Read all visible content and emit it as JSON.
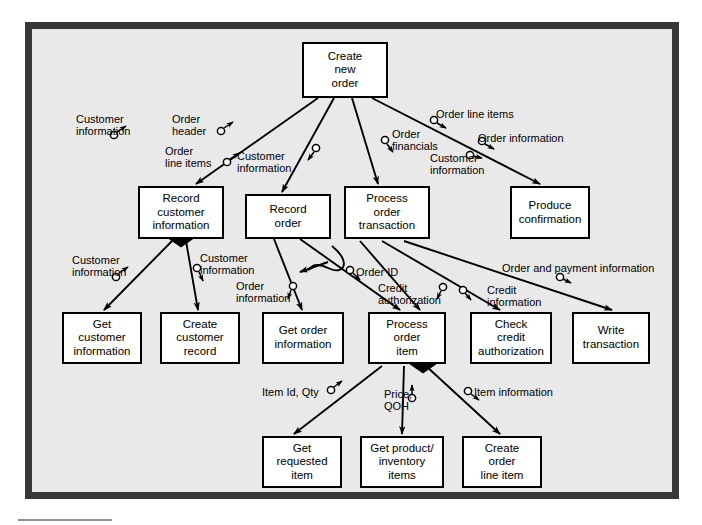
{
  "diagram": {
    "type": "structure-chart",
    "background_color": "#e9e9e9",
    "frame_color": "#373737",
    "node_fill": "#ffffff",
    "node_border": "#000000"
  },
  "nodes": [
    {
      "id": "create-new-order",
      "label": "Create\nnew\norder",
      "x": 302,
      "y": 42,
      "w": 86,
      "h": 56,
      "level": 0
    },
    {
      "id": "record-customer-info",
      "label": "Record\ncustomer\ninformation",
      "x": 138,
      "y": 186,
      "w": 86,
      "h": 53,
      "level": 1,
      "diamond": "bottom-center"
    },
    {
      "id": "record-order",
      "label": "Record\norder",
      "x": 245,
      "y": 194,
      "w": 86,
      "h": 45,
      "level": 1
    },
    {
      "id": "process-order-transaction",
      "label": "Process\norder\ntransaction",
      "x": 344,
      "y": 186,
      "w": 86,
      "h": 53,
      "level": 1
    },
    {
      "id": "produce-confirmation",
      "label": "Produce\nconfirmation",
      "x": 510,
      "y": 186,
      "w": 80,
      "h": 53,
      "level": 1
    },
    {
      "id": "get-customer-information",
      "label": "Get\ncustomer\ninformation",
      "x": 62,
      "y": 312,
      "w": 80,
      "h": 52,
      "level": 2
    },
    {
      "id": "create-customer-record",
      "label": "Create\ncustomer\nrecord",
      "x": 160,
      "y": 312,
      "w": 80,
      "h": 52,
      "level": 2
    },
    {
      "id": "get-order-information",
      "label": "Get order\ninformation",
      "x": 262,
      "y": 312,
      "w": 82,
      "h": 52,
      "level": 2
    },
    {
      "id": "process-order-item",
      "label": "Process\norder\nitem",
      "x": 368,
      "y": 312,
      "w": 78,
      "h": 52,
      "level": 2,
      "diamond": "bottom-right"
    },
    {
      "id": "check-credit-authorization",
      "label": "Check\ncredit\nauthorization",
      "x": 470,
      "y": 312,
      "w": 82,
      "h": 52,
      "level": 2
    },
    {
      "id": "write-transaction",
      "label": "Write\ntransaction",
      "x": 572,
      "y": 312,
      "w": 78,
      "h": 52,
      "level": 2
    },
    {
      "id": "get-requested-item",
      "label": "Get\nrequested\nitem",
      "x": 262,
      "y": 436,
      "w": 80,
      "h": 52,
      "level": 3
    },
    {
      "id": "get-product-inventory-items",
      "label": "Get product/\ninventory\nitems",
      "x": 360,
      "y": 436,
      "w": 84,
      "h": 52,
      "level": 3
    },
    {
      "id": "create-order-line-item",
      "label": "Create\norder\nline item",
      "x": 462,
      "y": 436,
      "w": 80,
      "h": 52,
      "level": 3
    }
  ],
  "couples": [
    {
      "id": "c1",
      "label": "Customer\ninformation",
      "x": 76,
      "y": 113,
      "align": "left",
      "direction": "down",
      "from": "create-new-order",
      "to": "record-customer-info"
    },
    {
      "id": "c2",
      "label": "Order\nheader",
      "x": 172,
      "y": 113,
      "align": "left",
      "direction": "up",
      "from": "record-customer-info",
      "to": "create-new-order"
    },
    {
      "id": "c3",
      "label": "Order\nline items",
      "x": 165,
      "y": 145,
      "align": "left",
      "direction": "up",
      "from": "record-order",
      "to": "create-new-order"
    },
    {
      "id": "c4",
      "label": "Customer\ninformation",
      "x": 237,
      "y": 150,
      "align": "left",
      "direction": "down",
      "from": "create-new-order",
      "to": "record-order"
    },
    {
      "id": "c5",
      "label": "Order\nfinancials",
      "x": 392,
      "y": 128,
      "align": "left",
      "direction": "down",
      "from": "create-new-order",
      "to": "process-order-transaction"
    },
    {
      "id": "c6",
      "label": "Order line items",
      "x": 436,
      "y": 108,
      "align": "left",
      "direction": "down",
      "from": "create-new-order",
      "to": "produce-confirmation"
    },
    {
      "id": "c7",
      "label": "Order information",
      "x": 478,
      "y": 132,
      "align": "left",
      "direction": "down",
      "from": "create-new-order",
      "to": "produce-confirmation"
    },
    {
      "id": "c8",
      "label": "Customer\ninformation",
      "x": 430,
      "y": 152,
      "align": "left",
      "direction": "down",
      "from": "create-new-order",
      "to": "produce-confirmation"
    },
    {
      "id": "c9",
      "label": "Customer\ninformation",
      "x": 72,
      "y": 254,
      "align": "left",
      "direction": "down",
      "from": "record-customer-info",
      "to": "get-customer-information"
    },
    {
      "id": "c10",
      "label": "Customer\ninformation",
      "x": 200,
      "y": 252,
      "align": "left",
      "direction": "down",
      "from": "record-customer-info",
      "to": "create-customer-record"
    },
    {
      "id": "c11",
      "label": "Order\ninformation",
      "x": 236,
      "y": 280,
      "align": "left",
      "direction": "down",
      "from": "record-order",
      "to": "get-order-information"
    },
    {
      "id": "c12",
      "label": "Order ID",
      "x": 356,
      "y": 266,
      "align": "left",
      "direction": "down",
      "from": "record-order",
      "to": "process-order-item"
    },
    {
      "id": "c13",
      "label": "Credit\nauthorization",
      "x": 378,
      "y": 282,
      "align": "left",
      "direction": "up",
      "from": "process-order-transaction",
      "to": "check-credit-authorization"
    },
    {
      "id": "c14",
      "label": "Credit\ninformation",
      "x": 487,
      "y": 284,
      "align": "left",
      "direction": "down",
      "from": "process-order-transaction",
      "to": "check-credit-authorization"
    },
    {
      "id": "c15",
      "label": "Order and payment information",
      "x": 502,
      "y": 262,
      "align": "left",
      "direction": "down",
      "from": "process-order-transaction",
      "to": "write-transaction"
    },
    {
      "id": "c16",
      "label": "Item Id, Qty",
      "x": 262,
      "y": 386,
      "align": "left",
      "direction": "up",
      "from": "get-requested-item",
      "to": "process-order-item"
    },
    {
      "id": "c17",
      "label": "Price,\nQOH",
      "x": 384,
      "y": 388,
      "align": "left",
      "direction": "up",
      "from": "get-product-inventory-items",
      "to": "process-order-item"
    },
    {
      "id": "c18",
      "label": "Item information",
      "x": 474,
      "y": 386,
      "align": "left",
      "direction": "down",
      "from": "process-order-item",
      "to": "create-order-line-item"
    }
  ]
}
